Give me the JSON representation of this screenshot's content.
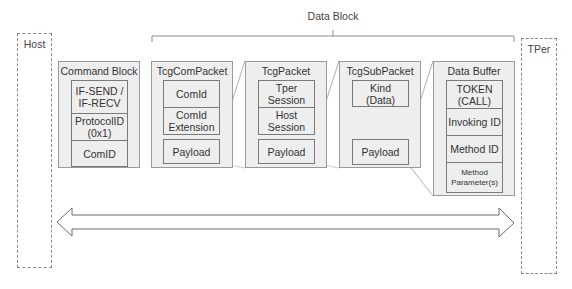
{
  "diagram": {
    "data_block_label": "Data Block",
    "host": {
      "label": "Host"
    },
    "tper": {
      "label": "TPer"
    },
    "command_block": {
      "title": "Command Block",
      "fields": [
        "IF-SEND /\nIF-RECV",
        "ProtocolID\n(0x1)",
        "ComID"
      ]
    },
    "tcg_com_packet": {
      "title": "TcgComPacket",
      "fields": [
        "ComId",
        "ComId\nExtension"
      ],
      "payload": "Payload"
    },
    "tcg_packet": {
      "title": "TcgPacket",
      "fields": [
        "Tper\nSession",
        "Host\nSession"
      ],
      "payload": "Payload"
    },
    "tcg_sub_packet": {
      "title": "TcgSubPacket",
      "fields": [
        "Kind\n(Data)"
      ],
      "payload": "Payload"
    },
    "data_buffer": {
      "title": "Data Buffer",
      "fields": [
        "TOKEN\n(CALL)",
        "Invoking ID",
        "Method ID",
        "Method\nParameter(s)"
      ]
    },
    "arrow": {
      "direction": "bidirectional"
    },
    "colors": {
      "box_fill": "#eeeeee",
      "box_border": "#9a9a9a",
      "line": "#8a8a8a"
    }
  }
}
